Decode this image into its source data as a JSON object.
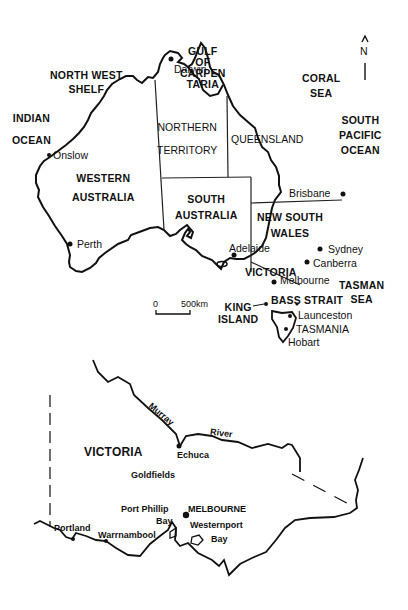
{
  "australia_map": {
    "regions": {
      "gulf": [
        "GULF",
        "OF",
        "CARPEN",
        "TARIA"
      ],
      "north_west_shelf": [
        "NORTH WEST",
        "SHELF"
      ],
      "indian_ocean": [
        "INDIAN",
        "OCEAN"
      ],
      "coral_sea": [
        "CORAL",
        "SEA"
      ],
      "south_pacific": [
        "SOUTH",
        "PACIFIC",
        "OCEAN"
      ],
      "northern_territory": [
        "NORTHERN",
        "TERRITORY"
      ],
      "queensland": "QUEENSLAND",
      "western_australia": [
        "WESTERN",
        "AUSTRALIA"
      ],
      "south_australia": [
        "SOUTH",
        "AUSTRALIA"
      ],
      "new_south_wales": [
        "NEW SOUTH",
        "WALES"
      ],
      "victoria": "VICTORIA",
      "tasman_sea": [
        "TASMAN",
        "SEA"
      ],
      "king_island": [
        "KING",
        "ISLAND"
      ],
      "bass_strait": "BASS STRAIT",
      "tasmania": "TASMANIA"
    },
    "cities": {
      "darwin": "Darwin",
      "onslow": "Onslow",
      "perth": "Perth",
      "brisbane": "Brisbane",
      "adelaide": "Adelaide",
      "sydney": "Sydney",
      "canberra": "Canberra",
      "melbourne": "Melbourne",
      "launceston": "Launceston",
      "hobart": "Hobart"
    },
    "north_arrow": "N",
    "scale": {
      "start": "0",
      "end": "500km"
    }
  },
  "victoria_map": {
    "title": "VICTORIA",
    "river": [
      "Murray",
      "River"
    ],
    "region_goldfields": "Goldfields",
    "capital": "MELBOURNE",
    "bays": {
      "port_phillip": [
        "Port Phillip",
        "Bay"
      ],
      "westernport": [
        "Westernport",
        "Bay"
      ]
    },
    "towns": {
      "echuca": "Echuca",
      "portland": "Portland",
      "warrnambool": "Warrnambool"
    }
  }
}
